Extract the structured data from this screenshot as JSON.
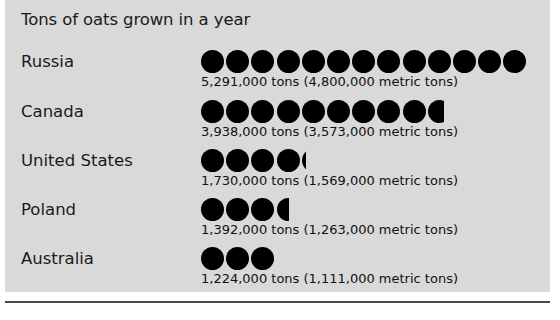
{
  "chart_data": {
    "type": "bar",
    "subtype": "pictogram",
    "title": "Tons of oats grown in a year",
    "xlabel": "",
    "ylabel": "",
    "categories": [
      "Russia",
      "Canada",
      "United States",
      "Poland",
      "Australia"
    ],
    "values": [
      5291000,
      3938000,
      1730000,
      1392000,
      1224000
    ],
    "values_metric": [
      4800000,
      3573000,
      1569000,
      1263000,
      1111000
    ],
    "unit": "tons",
    "unit_metric": "metric tons",
    "symbol": "circle",
    "symbol_color": "#000000",
    "symbol_value": 400000,
    "symbol_counts": [
      13,
      9.7,
      4.2,
      3.5,
      3
    ],
    "grid": false,
    "legend": "none",
    "rows": [
      {
        "label": "Russia",
        "caption": "5,291,000 tons (4,800,000 metric tons)",
        "tons": 5291000,
        "metric_tons": 4800000,
        "full_symbols": 13,
        "partial_fraction": 0
      },
      {
        "label": "Canada",
        "caption": "3,938,000 tons (3,573,000 metric tons)",
        "tons": 3938000,
        "metric_tons": 3573000,
        "full_symbols": 9,
        "partial_fraction": 0.7
      },
      {
        "label": "United States",
        "caption": "1,730,000 tons (1,569,000 metric tons)",
        "tons": 1730000,
        "metric_tons": 1569000,
        "full_symbols": 4,
        "partial_fraction": 0.2
      },
      {
        "label": "Poland",
        "caption": "1,392,000 tons (1,263,000 metric tons)",
        "tons": 1392000,
        "metric_tons": 1263000,
        "full_symbols": 3,
        "partial_fraction": 0.55
      },
      {
        "label": "Australia",
        "caption": "1,224,000 tons (1,111,000 metric tons)",
        "tons": 1224000,
        "metric_tons": 1111000,
        "full_symbols": 3,
        "partial_fraction": 0
      }
    ]
  },
  "figure": {
    "background_color": "#d9d9d9",
    "title": "Tons of oats grown in a year",
    "rows": [
      {
        "label": "Russia",
        "caption": "5,291,000 tons (4,800,000 metric tons)"
      },
      {
        "label": "Canada",
        "caption": "3,938,000 tons (3,573,000 metric tons)"
      },
      {
        "label": "United States",
        "caption": "1,730,000 tons (1,569,000 metric tons)"
      },
      {
        "label": "Poland",
        "caption": "1,392,000 tons (1,263,000 metric tons)"
      },
      {
        "label": "Australia",
        "caption": "1,224,000 tons (1,111,000 metric tons)"
      }
    ]
  }
}
